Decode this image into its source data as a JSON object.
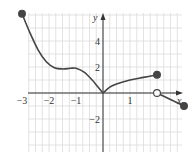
{
  "chart_data": {
    "type": "line",
    "title": "",
    "xlabel": "x",
    "ylabel": "y",
    "xlim": [
      -3,
      3
    ],
    "ylim": [
      -4.5,
      6.2
    ],
    "grid": true,
    "x_ticks": [
      {
        "value": -3,
        "label": "−3"
      },
      {
        "value": -2,
        "label": "−2"
      },
      {
        "value": -1,
        "label": "−1"
      },
      {
        "value": 1,
        "label": "1"
      }
    ],
    "y_ticks": [
      {
        "value": 4,
        "label": "4"
      },
      {
        "value": 2,
        "label": "2"
      },
      {
        "value": -2,
        "label": "−2"
      }
    ],
    "series": [
      {
        "name": "piece-1",
        "x": [
          -3,
          -2.7,
          -2.4,
          -2.1,
          -1.8,
          -1.5,
          -1.2,
          -1.0,
          -0.7,
          -0.4,
          -0.2,
          0
        ],
        "y": [
          6.1,
          4.6,
          3.3,
          2.4,
          1.95,
          1.85,
          1.9,
          1.9,
          1.6,
          1.0,
          0.5,
          0
        ],
        "start": {
          "x": -3,
          "y": 6.1,
          "marker": "filled"
        }
      },
      {
        "name": "piece-2",
        "x": [
          0,
          0.25,
          0.5,
          1.0,
          1.5,
          2
        ],
        "y": [
          0,
          0.45,
          0.7,
          1.0,
          1.2,
          1.4
        ],
        "end": {
          "x": 2,
          "y": 1.4,
          "marker": "filled"
        }
      },
      {
        "name": "piece-3",
        "x": [
          2,
          3
        ],
        "y": [
          0,
          -1
        ],
        "start": {
          "x": 2,
          "y": 0,
          "marker": "open"
        },
        "end": {
          "x": 3,
          "y": -1,
          "marker": "filled"
        }
      }
    ],
    "colors": {
      "curve": "#444444",
      "grid": "#dcdcdc",
      "axis": "#333333"
    }
  }
}
